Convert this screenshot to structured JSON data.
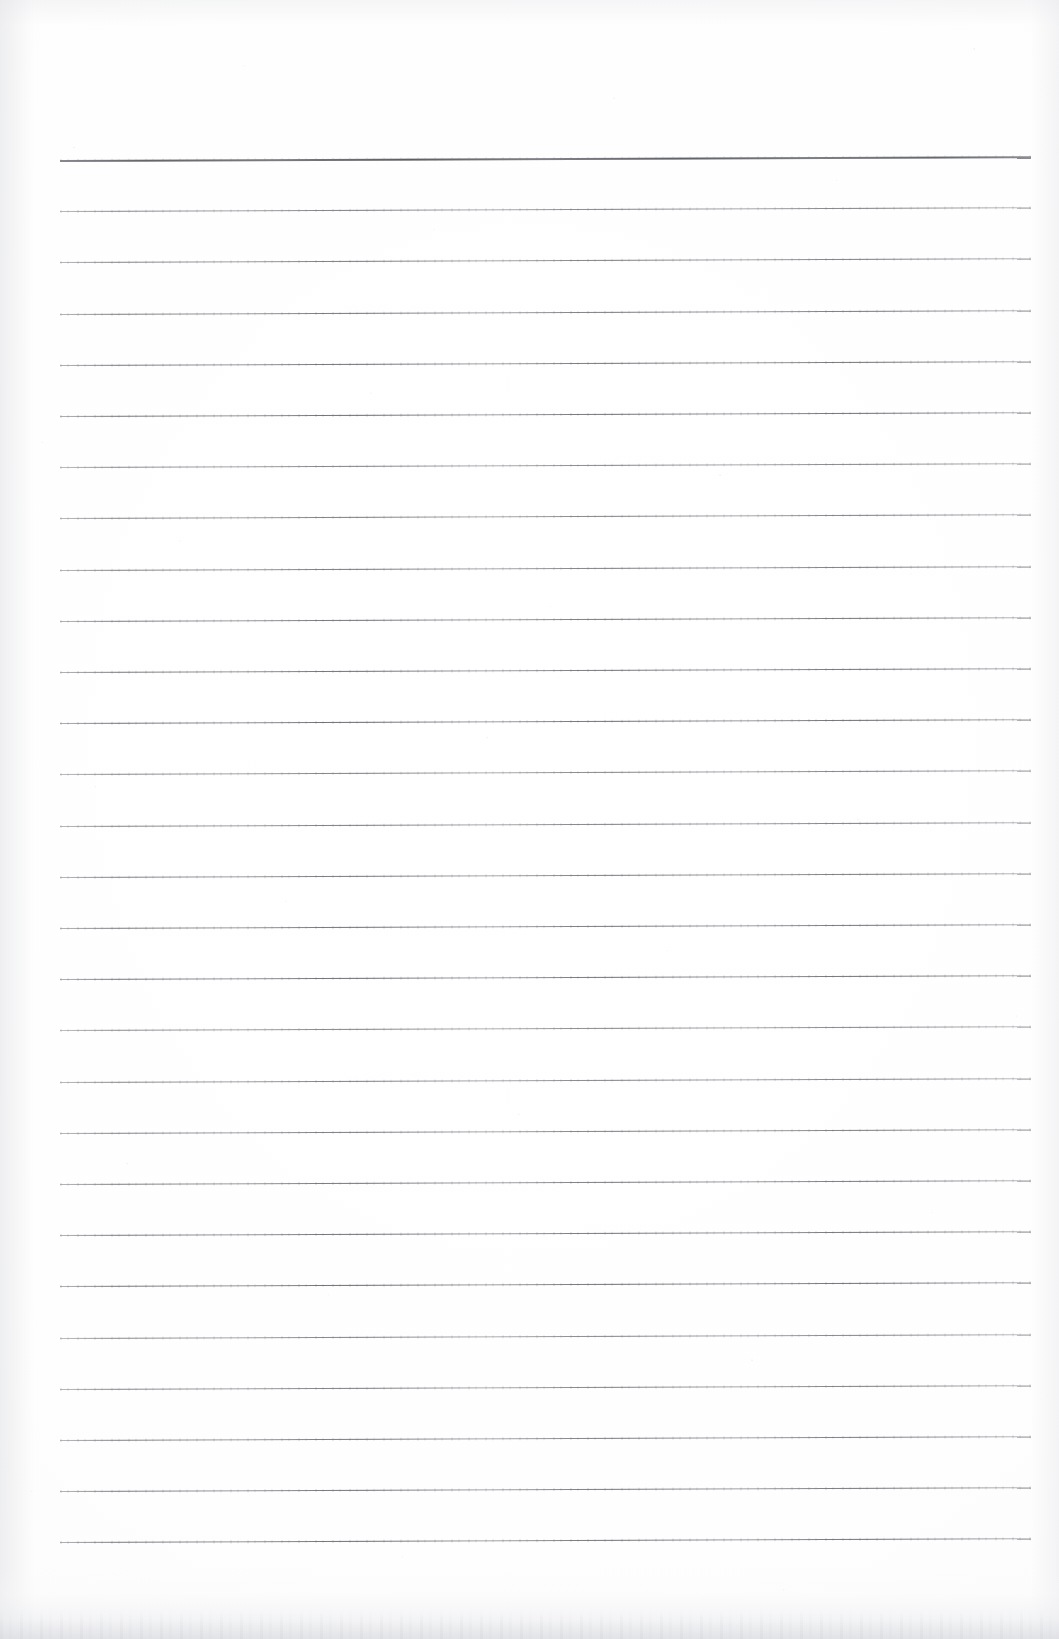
{
  "document": {
    "kind": "scanned-blank-ruled-paper",
    "page_width": 1059,
    "page_height": 1639,
    "background_color": "#ffffff",
    "paper_tone": "#fdfdfd",
    "rule_color": "#5a5c64",
    "head_rule_color": "#34363e",
    "text_content": "",
    "visible_text": []
  },
  "ruling": {
    "line_count": 28,
    "first_line_y": 160,
    "line_spacing": 51.2,
    "left_x": 60,
    "right_x": 1031,
    "line_length": 971,
    "skew_degrees": -0.22,
    "head_line_index": 0,
    "head_line_thickness": 2,
    "body_line_thickness": 1
  },
  "scan_artifacts": {
    "bottom_edge_shadow": true,
    "left_edge_bleed": true,
    "right_edge_bleed": true,
    "speckle": true
  }
}
